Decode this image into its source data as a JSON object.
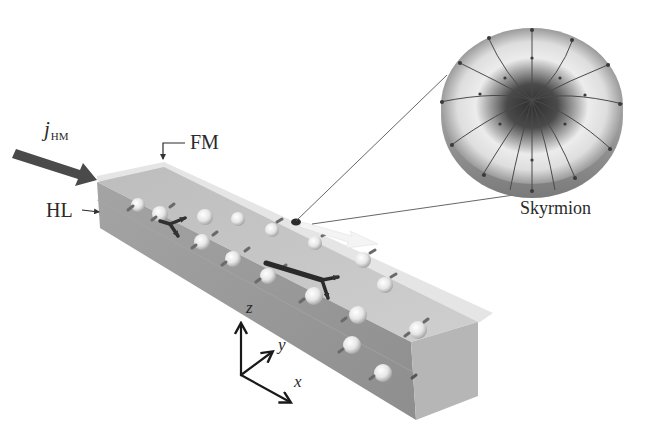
{
  "figure": {
    "labels": {
      "current_symbol": "j",
      "current_subscript": "HM",
      "fm_layer": "FM",
      "hl_layer": "HL",
      "skyrmion": "Skyrmion"
    },
    "axes": {
      "z": "z",
      "y": "y",
      "x": "x"
    },
    "colors": {
      "background": "#ffffff",
      "slab_front": "#9a9a9a",
      "slab_top": "#c4c4c4",
      "slab_end": "#b4b4b4",
      "fm_layer": "#dcdcdc",
      "arrows": "#3a3a3a",
      "skyrmion_motion_arrow": "#f2f2f2",
      "skyrmion_core": "#3c3c3c",
      "skyrmion_ring": "#e4e4e4"
    }
  }
}
